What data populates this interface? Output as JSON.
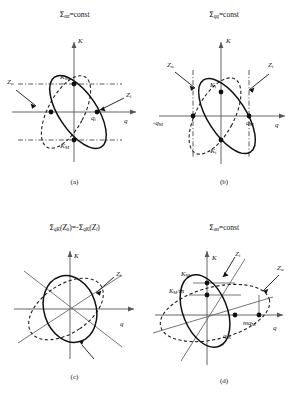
{
  "figure": {
    "axis_x_label": "q",
    "axis_y_label": "K"
  },
  "panels": [
    {
      "id": "a",
      "caption": "(a)",
      "title": "Σαα=const",
      "title_parts": {
        "sigma": "Σ",
        "subscript": "αα",
        "equals_const": "=const"
      },
      "labels": {
        "y_axis": "K",
        "x_axis": "q",
        "k_max": "K",
        "k_max_sub": "M",
        "k_min": "-K",
        "k_min_sub": "M",
        "q_i": "q",
        "q_i_sub": "i",
        "z_alpha": "Z",
        "z_alpha_sub": "α",
        "z_i": "Z",
        "z_i_sub": "i"
      }
    },
    {
      "id": "b",
      "caption": "(b)",
      "title": "Σqq=const",
      "title_parts": {
        "sigma": "Σ",
        "subscript": "qq",
        "equals_const": "=const"
      },
      "labels": {
        "y_axis": "K",
        "x_axis": "q",
        "k_i": "K",
        "k_i_sub": "i",
        "k_i_neg": "-K",
        "k_i_neg_sub": "i",
        "q_m_neg": "-q",
        "q_m_neg_sub": "M",
        "q_m": "q",
        "q_m_sub": "M",
        "z_alpha": "Z",
        "z_alpha_sub": "α",
        "z_i": "Z",
        "z_i_sub": "i"
      }
    },
    {
      "id": "c",
      "caption": "(c)",
      "title": "ΣqK(Zα)=-ΣqK(Zi)",
      "title_parts": {
        "sigma1": "Σ",
        "sub1": "qK",
        "arg1_open": "(Z",
        "arg1_sub": "α",
        "arg1_close": ")",
        "eq": "=-",
        "sigma2": "Σ",
        "sub2": "qK",
        "arg2_open": "(Z",
        "arg2_sub": "i",
        "arg2_close": ")"
      },
      "labels": {
        "y_axis": "K",
        "x_axis": "q",
        "z_i": "Z",
        "z_i_sub": "i"
      }
    },
    {
      "id": "d",
      "caption": "(d)",
      "title": "Σαα=const",
      "title_parts": {
        "sigma": "Σ",
        "subscript": "αα",
        "equals_const": "=const"
      },
      "labels": {
        "y_axis": "K",
        "x_axis": "q",
        "k_max": "K",
        "k_max_sub": "M",
        "k_over_m": "K",
        "k_over_m_sub": "M",
        "k_over_m_tail": "/m",
        "q_m": "q",
        "q_m_sub": "M",
        "mq_m": "mq",
        "mq_m_sub": "M",
        "z_alpha": "Z",
        "z_alpha_sub": "α",
        "z_i": "Z",
        "z_i_sub": "i"
      }
    }
  ],
  "style": {
    "line_color": "#1a1a1a",
    "axis_color": "#555555",
    "dash_color": "#222222",
    "background": "#ffffff"
  }
}
